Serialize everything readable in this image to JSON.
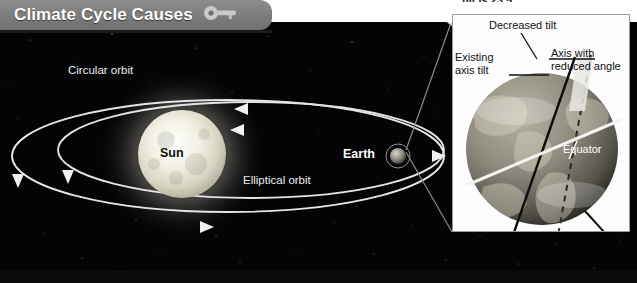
{
  "header": {
    "title": "Climate Cycle Causes",
    "icon": "key-icon"
  },
  "top_caption": {
    "text": "tilt is 23.5°"
  },
  "diagram": {
    "labels": {
      "circular_orbit": "Circular orbit",
      "elliptical_orbit": "Elliptical orbit",
      "sun": "Sun",
      "earth": "Earth"
    }
  },
  "inset": {
    "labels": {
      "decreased_tilt": "Decreased tilt",
      "existing_axis_tilt_line1": "Existing",
      "existing_axis_tilt_line2": "axis tilt",
      "axis_reduced_line1": "Axis with",
      "axis_reduced_line2": "reduced angle",
      "equator": "Equator"
    }
  },
  "colors": {
    "header_bar": "#7c7c7c",
    "space": "#040406",
    "orbit_line": "#e8e8e8",
    "inset_background": "#fdfdfd",
    "text_light": "#ececec",
    "text_dark": "#111111"
  }
}
